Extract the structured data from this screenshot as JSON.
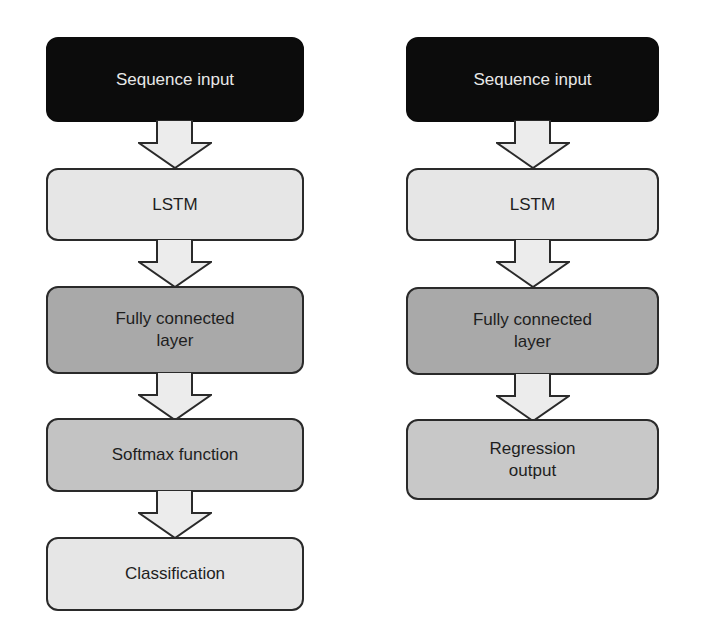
{
  "diagram": {
    "left_column": {
      "name": "classification-network",
      "nodes": [
        {
          "id": "seq_in_l",
          "label": "Sequence input",
          "style": "dark"
        },
        {
          "id": "lstm_l",
          "label": "LSTM",
          "style": "light"
        },
        {
          "id": "fc_l",
          "label": "Fully connected\nlayer",
          "style": "mid"
        },
        {
          "id": "softmax_l",
          "label": "Softmax function",
          "style": "soft"
        },
        {
          "id": "class_l",
          "label": "Classification",
          "style": "light"
        }
      ],
      "edges": [
        [
          "seq_in_l",
          "lstm_l"
        ],
        [
          "lstm_l",
          "fc_l"
        ],
        [
          "fc_l",
          "softmax_l"
        ],
        [
          "softmax_l",
          "class_l"
        ]
      ]
    },
    "right_column": {
      "name": "regression-network",
      "nodes": [
        {
          "id": "seq_in_r",
          "label": "Sequence input",
          "style": "dark"
        },
        {
          "id": "lstm_r",
          "label": "LSTM",
          "style": "light"
        },
        {
          "id": "fc_r",
          "label": "Fully connected\nlayer",
          "style": "mid"
        },
        {
          "id": "reg_r",
          "label": "Regression\noutput",
          "style": "soft"
        }
      ],
      "edges": [
        [
          "seq_in_r",
          "lstm_r"
        ],
        [
          "lstm_r",
          "fc_r"
        ],
        [
          "fc_r",
          "reg_r"
        ]
      ]
    },
    "colors": {
      "dark_fill": "#0c0c0c",
      "light_fill": "#e6e6e6",
      "mid_fill": "#a9a9a9",
      "soft_fill": "#c3c3c3",
      "arrow_fill": "#ececec",
      "stroke": "#2a2a2a"
    }
  }
}
